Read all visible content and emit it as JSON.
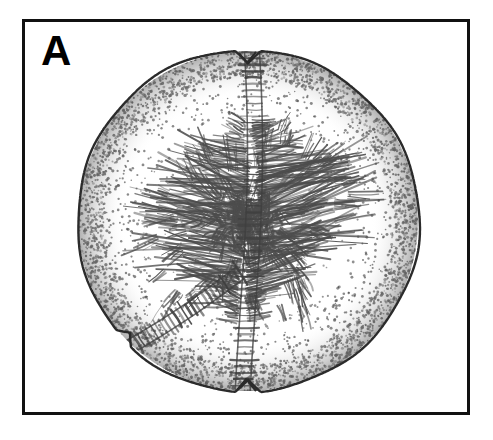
{
  "figure": {
    "panel_label": "A",
    "panel_label_name": "panel-label-a",
    "border_color": "#111111",
    "background_color": "#ffffff",
    "ink_color": "#3a3a3a",
    "outline_color": "#2b2b2b"
  },
  "specimen": {
    "type": "scientific-line-drawing",
    "subject": "spherical specimen, stippled with radiating dendritic interior",
    "rendering_technique": "stipple and hatch pen-and-ink",
    "body": {
      "shape": "circle",
      "center_x": 223,
      "center_y": 199,
      "radius": 171,
      "outline_width": 2.4
    },
    "features": [
      {
        "name": "apical-notch",
        "label": "apical notch",
        "position": "top",
        "x": 223,
        "y": 28
      },
      {
        "name": "basal-notch",
        "label": "basal notch",
        "position": "bottom",
        "x": 223,
        "y": 370
      },
      {
        "name": "vertical-suture",
        "label": "vertical sutural groove",
        "orientation": "vertical",
        "from_y": 30,
        "to_y": 368
      },
      {
        "name": "lower-left-suture",
        "label": "lower-left radial groove",
        "orientation": "diagonal",
        "angle_deg": 215
      },
      {
        "name": "central-dendritic-mass",
        "label": "central dendritic structure",
        "center_x": 223,
        "center_y": 200,
        "extent_x": 100,
        "extent_y": 95
      },
      {
        "name": "peripheral-stipple-shading",
        "label": "peripheral stipple shading",
        "density": "dense at rim, sparse at center"
      }
    ]
  }
}
